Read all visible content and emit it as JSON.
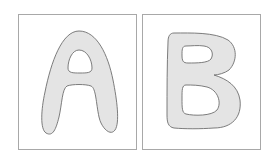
{
  "panels": [
    {
      "letter": "A",
      "fill": "#e4e4e4",
      "stroke": "#6e6e6e"
    },
    {
      "letter": "B",
      "fill": "#e4e4e4",
      "stroke": "#6e6e6e"
    }
  ],
  "colors": {
    "background": "#ffffff",
    "card_border": "#a8a8a8"
  }
}
